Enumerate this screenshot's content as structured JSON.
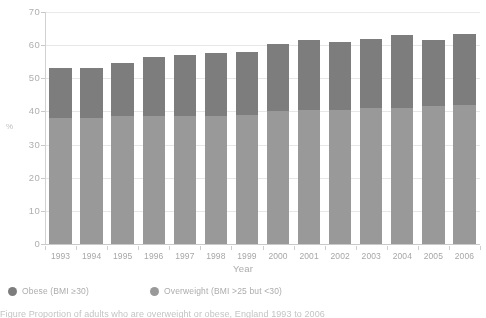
{
  "chart_data": {
    "type": "bar",
    "stacked": true,
    "title": "",
    "xlabel": "Year",
    "ylabel": "%",
    "ylim": [
      0,
      70
    ],
    "ytick_step": 10,
    "yticks": [
      "0",
      "10",
      "20",
      "30",
      "40",
      "50",
      "60",
      "70"
    ],
    "grid": true,
    "legend_position": "bottom-left",
    "categories": [
      "1993",
      "1994",
      "1995",
      "1996",
      "1997",
      "1998",
      "1999",
      "2000",
      "2001",
      "2002",
      "2003",
      "2004",
      "2005",
      "2006"
    ],
    "series": [
      {
        "name": "Overweight (BMI >25 but <30)",
        "color": "#909090",
        "values": [
          38.0,
          38.0,
          38.5,
          38.5,
          38.5,
          38.5,
          39.0,
          40.0,
          40.5,
          40.5,
          41.0,
          41.0,
          41.5,
          42.0
        ]
      },
      {
        "name": "Obese (BMI ≥30)",
        "color": "#6f6f6f",
        "values": [
          15.0,
          15.0,
          16.0,
          18.0,
          18.5,
          19.0,
          19.0,
          20.5,
          21.0,
          20.5,
          21.0,
          22.0,
          20.0,
          21.5
        ]
      }
    ],
    "totals": [
      53.0,
      53.0,
      54.5,
      56.5,
      57.0,
      57.5,
      58.0,
      60.5,
      61.5,
      61.0,
      62.0,
      63.0,
      61.5,
      63.5
    ]
  },
  "axes": {
    "y_title": "%",
    "x_title": "Year"
  },
  "legend": {
    "items": [
      {
        "label": "Obese (BMI ≥30)",
        "color": "#6f6f6f",
        "marker": "circle-dot"
      },
      {
        "label": "Overweight (BMI >25 but <30)",
        "color": "#909090",
        "marker": "circle-dot"
      }
    ]
  },
  "caption": {
    "line1": "Figure  Proportion of adults who are overweight or obese, England 1993 to 2006"
  },
  "colors": {
    "obese": "#6f6f6f",
    "overweight": "#909090",
    "grid": "#ececec",
    "axis": "#cfcfcf",
    "text": "#a6a6a6",
    "background": "#ffffff"
  }
}
